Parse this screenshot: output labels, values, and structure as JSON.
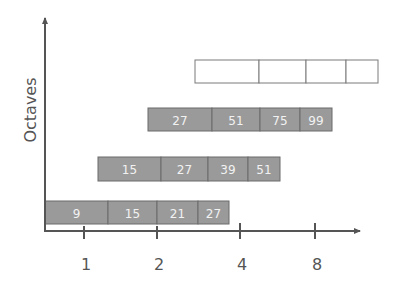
{
  "diagram": {
    "y_axis_label": "Octaves",
    "x_ticks": [
      "1",
      "2",
      "4",
      "8"
    ],
    "colors": {
      "filled": "#9a9a9a",
      "border": "#6b6b6b",
      "text": "#f2f2f2",
      "axis": "#555555"
    },
    "rows": [
      {
        "name": "row-1",
        "filled": true,
        "segments": [
          "9",
          "15",
          "21",
          "27"
        ]
      },
      {
        "name": "row-2",
        "filled": true,
        "segments": [
          "15",
          "27",
          "39",
          "51"
        ]
      },
      {
        "name": "row-3",
        "filled": true,
        "segments": [
          "27",
          "51",
          "75",
          "99"
        ]
      },
      {
        "name": "row-4",
        "filled": false,
        "segments": [
          "",
          "",
          "",
          ""
        ]
      }
    ]
  }
}
